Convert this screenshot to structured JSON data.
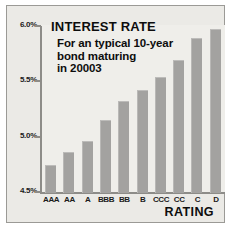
{
  "chart_data": {
    "type": "bar",
    "title": "INTEREST RATE",
    "subtitle_lines": [
      "For an typical 10-year",
      "bond maturing",
      "in 20003"
    ],
    "xlabel": "RATING",
    "ylabel": "",
    "categories": [
      "AAA",
      "AA",
      "A",
      "BBB",
      "BB",
      "B",
      "CCC",
      "CC",
      "C",
      "D"
    ],
    "values": [
      4.75,
      4.87,
      4.97,
      5.16,
      5.33,
      5.43,
      5.55,
      5.7,
      5.9,
      5.98
    ],
    "ylim": [
      4.5,
      6.0
    ],
    "ytick_values": [
      6.0,
      5.5,
      5.0,
      4.5
    ],
    "ytick_labels": [
      "6.0%",
      "5.5%",
      "5.0%",
      "4.5%"
    ],
    "grid": false,
    "legend": null,
    "bar_color": "#a3a2a0",
    "background_color": "#ebeae6",
    "axis_color": "#8d8c88",
    "text_color": "#0d0d0d"
  }
}
